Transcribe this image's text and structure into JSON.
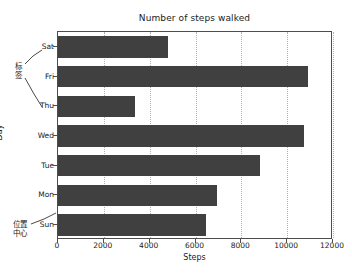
{
  "chart_data": {
    "type": "bar",
    "orientation": "horizontal",
    "title": "Number of steps walked",
    "xlabel": "Steps",
    "ylabel": "Day",
    "categories": [
      "Sun",
      "Mon",
      "Tue",
      "Wed",
      "Thu",
      "Fri",
      "Sat"
    ],
    "values": [
      6460,
      6940,
      8820,
      10730,
      3360,
      10900,
      4800
    ],
    "xlim": [
      0,
      12000
    ],
    "xticks": [
      0,
      2000,
      4000,
      6000,
      8000,
      10000,
      12000
    ],
    "xtick_labels": [
      "0",
      "2000",
      "4000",
      "6000",
      "8000",
      "10000",
      "12000"
    ],
    "ytick_labels": [
      "Sun",
      "Mon",
      "Tue",
      "Wed",
      "Thu",
      "Fri",
      "Sat"
    ],
    "grid": true,
    "grid_axis": "x",
    "legend": false,
    "bar_color": "#404040",
    "annotations": [
      {
        "text": "标签",
        "target": "ytick-labels"
      },
      {
        "text": "位置中心",
        "target": "ytick-label-sun"
      }
    ]
  },
  "annotations": {
    "label_callout": "标签",
    "center_callout_line1": "位置",
    "center_callout_line2": "中心"
  }
}
